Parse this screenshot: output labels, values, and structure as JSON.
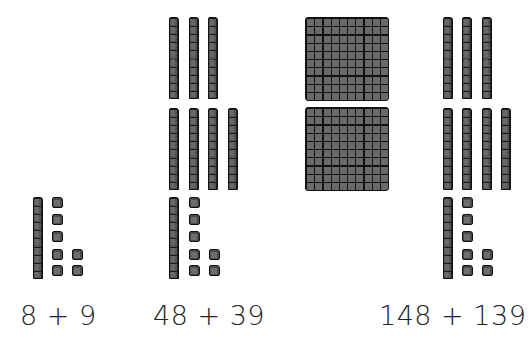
{
  "diagram": {
    "type": "base-ten-blocks",
    "background": "#ffffff",
    "block_color": "#3a3a3a",
    "groups": [
      {
        "label": "8 + 9",
        "sum": 17,
        "hundreds": 0,
        "tens": 1,
        "ones": 7
      },
      {
        "label": "48 + 39",
        "sum": 87,
        "hundreds": 0,
        "tens": 8,
        "ones": 7
      },
      {
        "label": "148 + 139",
        "sum": 287,
        "hundreds": 2,
        "tens": 8,
        "ones": 7
      }
    ]
  }
}
